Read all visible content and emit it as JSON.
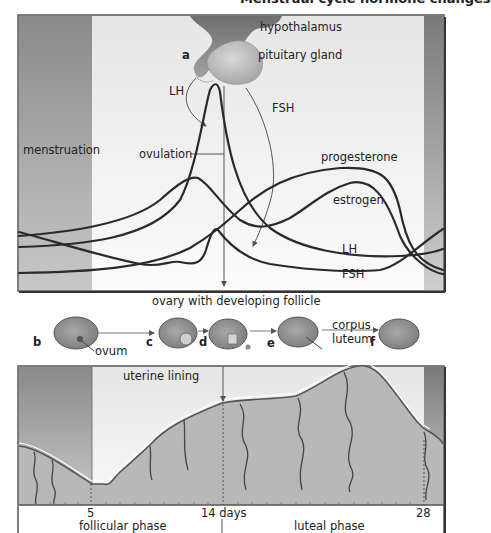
{
  "header": {
    "title_fragment": "Menstrual cycle hormone changes"
  },
  "hormone_panel": {
    "structures": {
      "hypothalamus": "hypothalamus",
      "pituitary": "pituitary gland"
    },
    "panel_letter": "a",
    "arrow_labels": {
      "lh": "LH",
      "fsh": "FSH"
    },
    "menstruation": "menstruation",
    "ovulation": "ovulation",
    "curve_labels": {
      "progesterone": "progesterone",
      "estrogen": "estrogen",
      "lh": "LH",
      "fsh": "FSH"
    }
  },
  "ovary_row": {
    "title": "ovary with developing follicle",
    "stages": [
      {
        "letter": "b",
        "note": "ovum"
      },
      {
        "letter": "c",
        "note": ""
      },
      {
        "letter": "d",
        "note": ""
      },
      {
        "letter": "e",
        "note": "corpus luteum"
      },
      {
        "letter": "f",
        "note": ""
      }
    ],
    "corpus_line1": "corpus",
    "corpus_line2": "luteum"
  },
  "uterine_panel": {
    "title": "uterine lining",
    "ticks": {
      "day5": "5",
      "day14": "14 days",
      "day28": "28"
    },
    "phases": {
      "follicular": "follicular phase",
      "luteal": "luteal phase"
    }
  },
  "colors": {
    "curve": "#2a2a2a",
    "band_dark": "#8c8c8c",
    "tissue": "#b8b8b8",
    "panel_bg": "#f1f1f1",
    "frame": "#555555"
  }
}
